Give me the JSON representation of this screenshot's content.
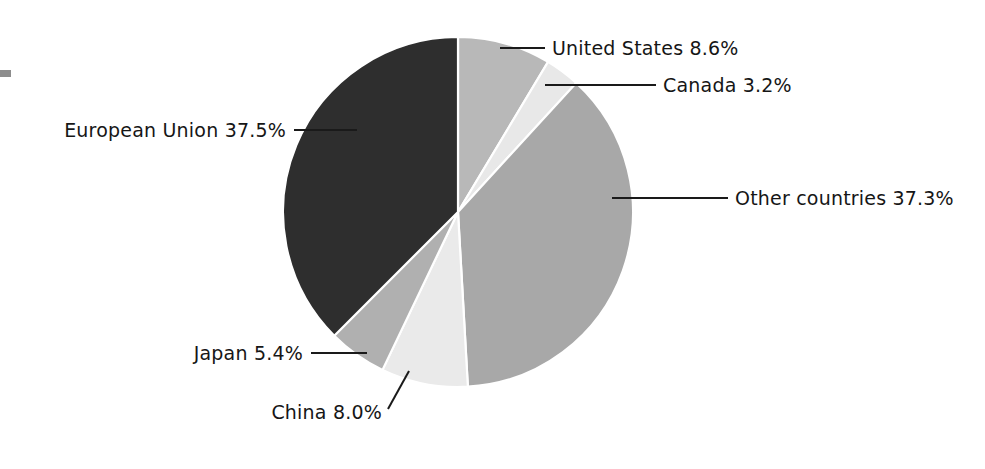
{
  "chart_data": {
    "type": "pie",
    "title": "",
    "subtitle": "",
    "xlabel": "",
    "ylabel": "",
    "legend_position": "none",
    "grid": false,
    "unit": "%",
    "start_angle_deg": 0,
    "direction": "clockwise",
    "categories": [
      "United States",
      "Canada",
      "Other countries",
      "China",
      "Japan",
      "European Union"
    ],
    "values": [
      8.6,
      3.2,
      37.3,
      8.0,
      5.4,
      37.5
    ],
    "slices": [
      {
        "name": "United States",
        "value": 8.6,
        "value_text": "8.6%",
        "label": "United States 8.6%",
        "color": "#b8b8b8",
        "label_anchor": "start",
        "label_x": 552,
        "label_y": 55,
        "leader": "M 500 48 L 545 48"
      },
      {
        "name": "Canada",
        "value": 3.2,
        "value_text": "3.2%",
        "label": "Canada 3.2%",
        "color": "#e8e8e8",
        "label_anchor": "start",
        "label_x": 663,
        "label_y": 92,
        "leader": "M 545 85 L 656 85"
      },
      {
        "name": "Other countries",
        "value": 37.3,
        "value_text": "37.3%",
        "label": "Other countries 37.3%",
        "color": "#a8a8a8",
        "label_anchor": "start",
        "label_x": 735,
        "label_y": 205,
        "leader": "M 612 198 L 728 198"
      },
      {
        "name": "China",
        "value": 8.0,
        "value_text": "8.0%",
        "label": "China 8.0%",
        "color": "#eaeaea",
        "label_anchor": "end",
        "label_x": 382,
        "label_y": 419,
        "leader": "M 409 371 L 388 409"
      },
      {
        "name": "Japan",
        "value": 5.4,
        "value_text": "5.4%",
        "label": "Japan 5.4%",
        "color": "#b0b0b0",
        "label_anchor": "end",
        "label_x": 303,
        "label_y": 360,
        "leader": "M 311 353 L 367 353"
      },
      {
        "name": "European Union",
        "value": 37.5,
        "value_text": "37.5%",
        "label": "European Union 37.5%",
        "color": "#2e2e2e",
        "label_anchor": "end",
        "label_x": 286,
        "label_y": 137,
        "leader": "M 294 130 L 357 130"
      }
    ],
    "geometry": {
      "center_x": 458,
      "center_y": 212,
      "radius": 175
    }
  },
  "background_color": "#ffffff",
  "text_color": "#161616",
  "leader_color": "#1a1a1a",
  "separator_color": "#ffffff"
}
